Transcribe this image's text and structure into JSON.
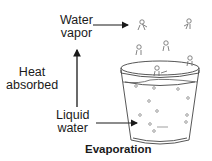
{
  "diagram": {
    "title": "Evaporation",
    "labels": {
      "vapor_line1": "Water",
      "vapor_line2": "vapor",
      "heat_line1": "Heat",
      "heat_line2": "absorbed",
      "liquid_line1": "Liquid",
      "liquid_line2": "water"
    },
    "arrows": [
      {
        "from": "liquid-water",
        "to": "water-vapor",
        "label": "Heat absorbed",
        "direction": "up"
      },
      {
        "from": "water-vapor-label",
        "to": "vapor-molecules",
        "direction": "right"
      },
      {
        "from": "liquid-water-label",
        "to": "glass-water",
        "direction": "right"
      }
    ],
    "elements": {
      "container": "glass of water",
      "molecules_in_air": 6,
      "molecules_in_liquid": 12
    },
    "colors": {
      "ink": "#1a1a1a",
      "line": "#555555"
    }
  }
}
